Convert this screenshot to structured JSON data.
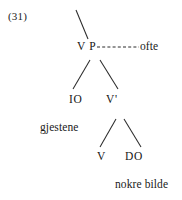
{
  "figure": {
    "example_number": "(31)",
    "type": "syntax-tree",
    "language": "Norwegian"
  },
  "nodes": {
    "vp": "V P",
    "io": "IO",
    "vbar": "V'",
    "v": "V",
    "do": "DO"
  },
  "terminals": {
    "adjunct": "ofte",
    "indirect_object": "gjestene",
    "direct_object": "nokre bilde"
  },
  "style": {
    "line_color": "#2b2b2b",
    "text_color": "#1c1c1c",
    "background": "#ffffff"
  },
  "branches": [
    {
      "name": "mother-to-vp",
      "x1": 76,
      "y1": 10,
      "x2": 88,
      "y2": 39,
      "dashed": false
    },
    {
      "name": "vp-to-io",
      "x1": 90,
      "y1": 60,
      "x2": 73,
      "y2": 89,
      "dashed": false
    },
    {
      "name": "vp-to-vbar",
      "x1": 100,
      "y1": 60,
      "x2": 118,
      "y2": 89,
      "dashed": false
    },
    {
      "name": "vp-to-adjunct",
      "x1": 97,
      "y1": 47,
      "x2": 139,
      "y2": 47,
      "dashed": true
    },
    {
      "name": "vbar-to-v",
      "x1": 116,
      "y1": 119,
      "x2": 100,
      "y2": 147,
      "dashed": false
    },
    {
      "name": "vbar-to-do",
      "x1": 124,
      "y1": 119,
      "x2": 141,
      "y2": 147,
      "dashed": false
    }
  ]
}
